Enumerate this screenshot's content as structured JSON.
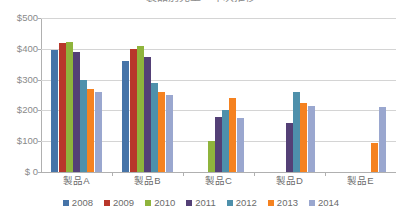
{
  "chart_data": {
    "type": "bar",
    "title": "製品別売上　年次推移",
    "xlabel": "",
    "ylabel": "",
    "ylim": [
      0,
      500
    ],
    "ytick_values": [
      0,
      100,
      200,
      300,
      400,
      500
    ],
    "ytick_labels": [
      "$ 0",
      "$100",
      "$200",
      "$300",
      "$400",
      "$500"
    ],
    "categories": [
      "製品A",
      "製品B",
      "製品C",
      "製品D",
      "製品E"
    ],
    "grid": true,
    "legend_position": "bottom",
    "series": [
      {
        "name": "2008",
        "color": "#4674a8",
        "values": [
          395,
          360,
          null,
          null,
          null
        ]
      },
      {
        "name": "2009",
        "color": "#b8372b",
        "values": [
          418,
          398,
          null,
          null,
          null
        ]
      },
      {
        "name": "2010",
        "color": "#8fb43c",
        "values": [
          422,
          408,
          100,
          null,
          null
        ]
      },
      {
        "name": "2011",
        "color": "#544076",
        "values": [
          390,
          374,
          180,
          158,
          null
        ]
      },
      {
        "name": "2012",
        "color": "#4e90ab",
        "values": [
          300,
          289,
          200,
          260,
          null
        ]
      },
      {
        "name": "2013",
        "color": "#f58220",
        "values": [
          270,
          260,
          240,
          225,
          95
        ]
      },
      {
        "name": "2014",
        "color": "#9aa7cf",
        "values": [
          260,
          250,
          175,
          215,
          210
        ]
      }
    ]
  },
  "legend": {
    "items": [
      {
        "label": "2008"
      },
      {
        "label": "2009"
      },
      {
        "label": "2010"
      },
      {
        "label": "2011"
      },
      {
        "label": "2012"
      },
      {
        "label": "2013"
      },
      {
        "label": "2014"
      }
    ]
  }
}
